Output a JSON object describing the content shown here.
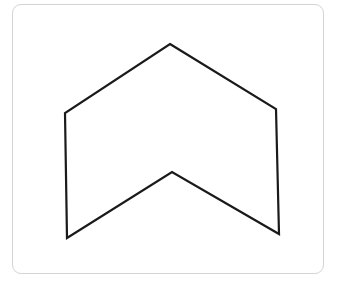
{
  "figure": {
    "frame": {
      "x": 12,
      "y": 4,
      "width": 312,
      "height": 270,
      "radius": 9,
      "stroke": "#d4d4d4"
    },
    "shape": {
      "type": "polygon",
      "name": "chevron-hexagon",
      "stroke": "#1a1a1a",
      "stroke_width": 2.2,
      "fill": "none",
      "points": "170,44 276,109 279,234 172,172 67,238 65,113",
      "vertices": [
        {
          "label": "top-apex",
          "x": 170,
          "y": 44
        },
        {
          "label": "right-upper",
          "x": 276,
          "y": 109
        },
        {
          "label": "right-lower",
          "x": 279,
          "y": 234
        },
        {
          "label": "inner-notch",
          "x": 172,
          "y": 172
        },
        {
          "label": "left-lower",
          "x": 67,
          "y": 238
        },
        {
          "label": "left-upper",
          "x": 65,
          "y": 113
        }
      ]
    }
  }
}
